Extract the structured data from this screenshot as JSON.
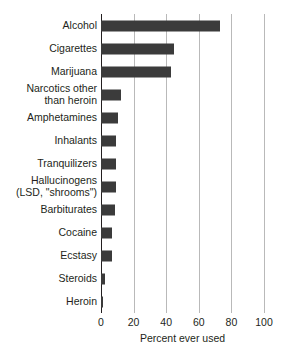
{
  "chart_data": {
    "type": "bar",
    "orientation": "horizontal",
    "title": "",
    "xlabel": "Percent ever used",
    "ylabel": "",
    "xlim": [
      0,
      100
    ],
    "xticks": [
      0,
      20,
      40,
      60,
      80,
      100
    ],
    "xtick_labels": [
      "0",
      "20",
      "40",
      "60",
      "80",
      "100"
    ],
    "grid": true,
    "legend": null,
    "bar_color": "#3b3b3b",
    "gridline_color": "#b9b9b9",
    "axis_color": "#231f20",
    "categories": [
      "Alcohol",
      "Cigarettes",
      "Marijuana",
      "Narcotics other\nthan heroin",
      "Amphetamines",
      "Inhalants",
      "Tranquilizers",
      "Hallucinogens\n(LSD, \"shrooms\")",
      "Barbiturates",
      "Cocaine",
      "Ecstasy",
      "Steroids",
      "Heroin"
    ],
    "values": [
      73,
      45,
      43,
      12,
      10.5,
      9.5,
      9,
      9,
      8.5,
      7,
      6.5,
      2.5,
      1.5
    ]
  }
}
